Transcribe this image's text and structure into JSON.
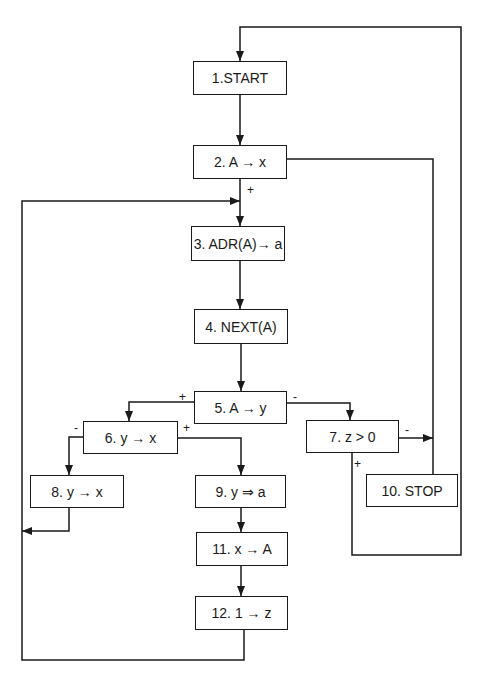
{
  "diagram": {
    "type": "flowchart",
    "nodes": [
      {
        "id": "1",
        "label": "1.START",
        "x": 193,
        "y": 61,
        "w": 94,
        "h": 34
      },
      {
        "id": "2",
        "label": "2. A → x",
        "x": 193,
        "y": 145,
        "w": 94,
        "h": 34
      },
      {
        "id": "3",
        "label": "3. ADR(A)→ a",
        "x": 191,
        "y": 226,
        "w": 94,
        "h": 35
      },
      {
        "id": "4",
        "label": "4. NEXT(A)",
        "x": 194,
        "y": 309,
        "w": 94,
        "h": 35
      },
      {
        "id": "5",
        "label": "5. A → y",
        "x": 194,
        "y": 391,
        "w": 93,
        "h": 33
      },
      {
        "id": "6",
        "label": "6. y → x",
        "x": 83,
        "y": 421,
        "w": 95,
        "h": 33
      },
      {
        "id": "7",
        "label": "7. z > 0",
        "x": 306,
        "y": 420,
        "w": 93,
        "h": 33
      },
      {
        "id": "8",
        "label": "8. y → x",
        "x": 30,
        "y": 475,
        "w": 94,
        "h": 33
      },
      {
        "id": "9",
        "label": "9. y ⇒ a",
        "x": 195,
        "y": 475,
        "w": 91,
        "h": 33
      },
      {
        "id": "10",
        "label": "10. STOP",
        "x": 366,
        "y": 474,
        "w": 92,
        "h": 33
      },
      {
        "id": "11",
        "label": "11. x → A",
        "x": 196,
        "y": 532,
        "w": 92,
        "h": 34
      },
      {
        "id": "12",
        "label": "12. 1 → z",
        "x": 195,
        "y": 596,
        "w": 93,
        "h": 34
      }
    ],
    "edges": [
      {
        "from": "1",
        "to": "2",
        "label": ""
      },
      {
        "from": "2",
        "to": "3",
        "label": "+"
      },
      {
        "from": "2",
        "to": "10",
        "label": ""
      },
      {
        "from": "3",
        "to": "4",
        "label": ""
      },
      {
        "from": "4",
        "to": "5",
        "label": ""
      },
      {
        "from": "5",
        "to": "6",
        "label": "+"
      },
      {
        "from": "5",
        "to": "7",
        "label": "-"
      },
      {
        "from": "6",
        "to": "8",
        "label": "-"
      },
      {
        "from": "6",
        "to": "9",
        "label": "+"
      },
      {
        "from": "7",
        "to": "10",
        "label": "-"
      },
      {
        "from": "7",
        "to": "1",
        "label": "+"
      },
      {
        "from": "8",
        "to": "3",
        "label": ""
      },
      {
        "from": "9",
        "to": "11",
        "label": ""
      },
      {
        "from": "11",
        "to": "12",
        "label": ""
      },
      {
        "from": "12",
        "to": "3",
        "label": ""
      }
    ],
    "edge_labels": [
      {
        "text": "+",
        "x": 247,
        "y": 184
      },
      {
        "text": "+",
        "x": 179,
        "y": 391
      },
      {
        "text": "-",
        "x": 293,
        "y": 391
      },
      {
        "text": "-",
        "x": 74,
        "y": 422
      },
      {
        "text": "+",
        "x": 183,
        "y": 422
      },
      {
        "text": "-",
        "x": 405,
        "y": 424
      },
      {
        "text": "+",
        "x": 354,
        "y": 458
      }
    ],
    "colors": {
      "stroke": "#1a1a1a",
      "background": "#ffffff"
    }
  }
}
